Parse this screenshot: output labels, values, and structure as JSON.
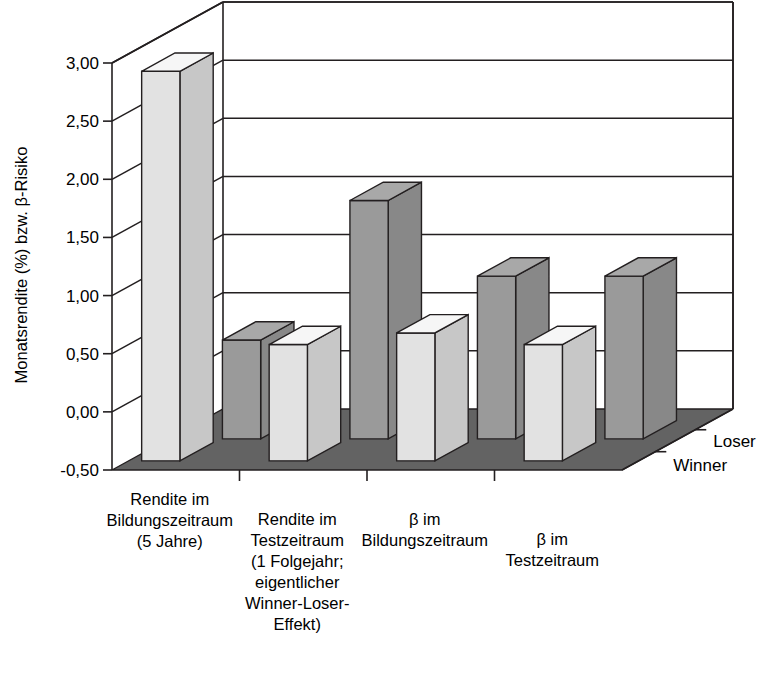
{
  "chart_data": {
    "type": "bar",
    "title": "",
    "subtitle": "",
    "xlabel": "",
    "ylabel": "Monatsrendite (%) bzw. β-Risiko",
    "ylim": [
      -0.5,
      3.0
    ],
    "ytick_labels": [
      "3,00",
      "2,50",
      "2,00",
      "1,50",
      "1,00",
      "0,50",
      "0,00",
      "-0,50"
    ],
    "ytick_values": [
      3.0,
      2.5,
      2.0,
      1.5,
      1.0,
      0.5,
      0.0,
      -0.5
    ],
    "grid": true,
    "legend_position": "depth-axis-right",
    "projection": "3d",
    "categories": [
      "Rendite im\nBildungszeitraum\n(5 Jahre)",
      "Rendite im\nTestzeitraum\n(1 Folgejahr;\neigentlicher\nWinner-Loser-\nEffekt)",
      "β im\nBildungszeitraum",
      "β im\nTestzeitraum"
    ],
    "category_lines": [
      [
        "Rendite im",
        "Bildungszeitraum",
        "(5 Jahre)"
      ],
      [
        "Rendite im",
        "Testzeitraum",
        "(1 Folgejahr;",
        "eigentlicher",
        "Winner-Loser-",
        "Effekt)"
      ],
      [
        "β im",
        "Bildungszeitraum"
      ],
      [
        "β im",
        "Testzeitraum"
      ]
    ],
    "series": [
      {
        "name": "Loser",
        "row": "back",
        "values": [
          0.35,
          1.55,
          0.9,
          0.9
        ],
        "color": "#9a9a9a"
      },
      {
        "name": "Winner",
        "row": "front",
        "values": [
          2.85,
          0.5,
          0.6,
          0.5
        ],
        "color": "#e2e2e2"
      }
    ]
  },
  "legend": {
    "loser_label": "Loser",
    "winner_label": "Winner"
  },
  "axis": {
    "y_title": "Monatsrendite (%) bzw. β-Risiko",
    "ticks": [
      "3,00",
      "2,50",
      "2,00",
      "1,50",
      "1,00",
      "0,50",
      "0,00",
      "-0,50"
    ]
  },
  "colors": {
    "bar_light": "#e2e2e2",
    "bar_light_side": "#c9c9c9",
    "bar_light_top": "#ededed",
    "bar_dark": "#9a9a9a",
    "bar_dark_side": "#7f7f7f",
    "bar_dark_top": "#b0b0b0",
    "floor": "#636363",
    "wall": "#ffffff",
    "line": "#231f20"
  }
}
